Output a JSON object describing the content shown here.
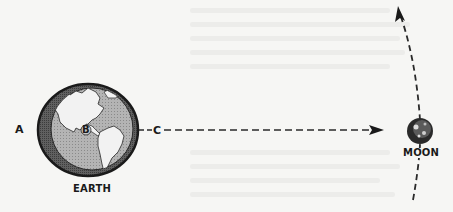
{
  "diagram": {
    "labels": {
      "point_a": "A",
      "point_b": "B",
      "point_c": "C",
      "earth": "EARTH",
      "moon": "MOON"
    },
    "elements": {
      "earth": {
        "icon": "earth-globe-icon",
        "shows": "North and South America"
      },
      "moon": {
        "icon": "moon-icon"
      },
      "straight_arrow": {
        "from": "C",
        "to": "MOON",
        "style": "dashed"
      },
      "orbit_arrow": {
        "path": "curved dashed arc through MOON",
        "direction": "upward"
      }
    },
    "colors": {
      "ink": "#1a1a1a",
      "ocean": "#a9a9a9",
      "land": "#f2f2f2",
      "ring": "#555555",
      "paper": "#f6f6f4"
    }
  }
}
